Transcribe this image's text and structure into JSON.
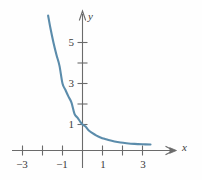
{
  "chart_data": {
    "type": "line",
    "title": "",
    "subtitle": "",
    "xlabel": "x",
    "ylabel": "y",
    "function": "y = (1/3)^x",
    "xlim": [
      -3.6,
      4.2
    ],
    "ylim": [
      -0.9,
      6.8
    ],
    "grid": false,
    "legend": null,
    "x_ticks": [
      -3,
      -2,
      -1,
      1,
      2,
      3
    ],
    "x_tick_labels": [
      "−3",
      "",
      "−1",
      "1",
      "",
      "3"
    ],
    "y_ticks": [
      1,
      2,
      3,
      4,
      5
    ],
    "y_tick_labels": [
      "1",
      "",
      "3",
      "",
      "5"
    ],
    "series": [
      {
        "name": "exponential-decay",
        "color": "#5b8cab",
        "linewidth": 2.1,
        "x": [
          -1.72,
          -1.6,
          -1.45,
          -1.3,
          -1.15,
          -1.0,
          -0.85,
          -0.7,
          -0.55,
          -0.4,
          -0.25,
          -0.1,
          0.0,
          0.15,
          0.3,
          0.5,
          0.7,
          0.9,
          1.1,
          1.3,
          1.6,
          1.9,
          2.2,
          2.6,
          3.0,
          3.4
        ],
        "y": [
          6.32,
          5.68,
          4.99,
          4.39,
          3.86,
          3.0,
          2.68,
          2.36,
          2.07,
          1.52,
          1.33,
          1.12,
          1.0,
          0.9,
          0.72,
          0.58,
          0.46,
          0.37,
          0.3,
          0.24,
          0.17,
          0.12,
          0.087,
          0.055,
          0.037,
          0.026
        ]
      }
    ],
    "axis_color": "#6b6b6b",
    "axis_arrows": [
      "x-positive",
      "y-positive"
    ]
  },
  "labels": {
    "x_axis_name": "x",
    "y_axis_name": "y",
    "x_neg3": "−3",
    "x_neg1": "−1",
    "x_pos1": "1",
    "x_pos3": "3",
    "y_1": "1",
    "y_3": "3",
    "y_5": "5"
  }
}
